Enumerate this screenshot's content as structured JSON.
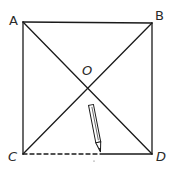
{
  "diagram": {
    "type": "square-with-diagonals",
    "points": {
      "A": {
        "label": "A",
        "x": 23,
        "y": 22
      },
      "B": {
        "label": "B",
        "x": 152,
        "y": 23
      },
      "C": {
        "label": "C",
        "x": 23,
        "y": 154
      },
      "D": {
        "label": "D",
        "x": 152,
        "y": 154
      },
      "O": {
        "label": "O",
        "x": 87,
        "y": 88
      }
    },
    "segments": [
      {
        "from": "A",
        "to": "B",
        "style": "solid"
      },
      {
        "from": "A",
        "to": "C",
        "style": "solid"
      },
      {
        "from": "B",
        "to": "D",
        "style": "solid"
      },
      {
        "from": "A",
        "to": "D",
        "style": "solid"
      },
      {
        "from": "B",
        "to": "C",
        "style": "solid"
      },
      {
        "from": "C",
        "to": "D",
        "style": "partially-dashed",
        "note": "dashed from C to pencil tip, solid from pencil tip to D"
      }
    ],
    "pencil": {
      "tip": {
        "x": 100,
        "y": 154
      },
      "end": {
        "x": 91,
        "y": 105
      }
    },
    "colors": {
      "stroke": "#1a1a1a",
      "background": "#ffffff"
    }
  }
}
